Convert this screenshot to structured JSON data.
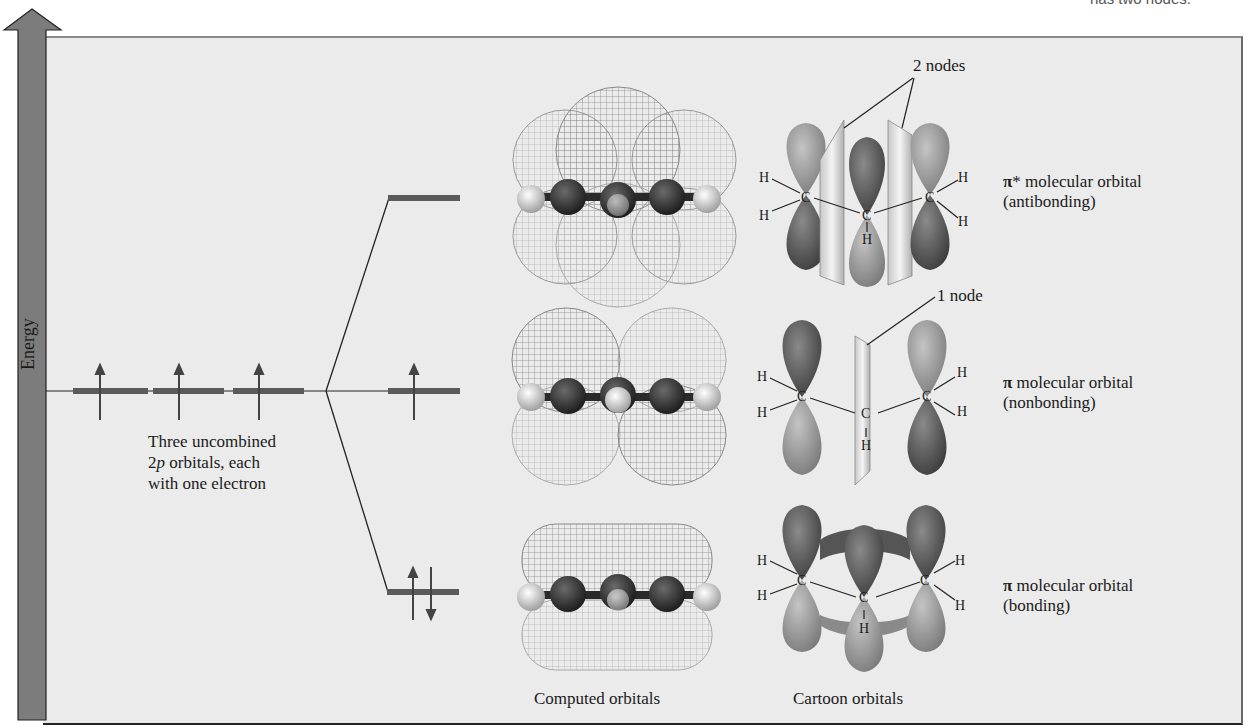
{
  "figure": {
    "cut_caption": "has two nodes.",
    "axis": {
      "label": "Energy"
    },
    "atomic_orbitals": {
      "caption_line1": "Three uncombined",
      "caption_line2_prefix": "2",
      "caption_line2_italic": "p",
      "caption_line2_suffix": " orbitals, each",
      "caption_line3": "with one electron",
      "count": 3,
      "electrons_each": 1
    },
    "molecular_orbitals": [
      {
        "name": "pi-star",
        "symbol": "π",
        "symbol_suffix": "*",
        "line1": " molecular orbital",
        "line2": "(antibonding)",
        "electrons": 0,
        "nodes_label": "2 nodes"
      },
      {
        "name": "pi-nonbonding",
        "symbol": "π",
        "symbol_suffix": "",
        "line1": " molecular orbital",
        "line2": "(nonbonding)",
        "electrons": 1,
        "nodes_label": "1 node"
      },
      {
        "name": "pi-bonding",
        "symbol": "π",
        "symbol_suffix": "",
        "line1": " molecular orbital",
        "line2": "(bonding)",
        "electrons": 2,
        "nodes_label": ""
      }
    ],
    "column_labels": {
      "computed": "Computed orbitals",
      "cartoon": "Cartoon orbitals"
    },
    "atom_labels": {
      "carbon": "C",
      "hydrogen": "H"
    },
    "colors": {
      "panel_bg": "#ebebeb",
      "energy_bar": "#7a7a7a",
      "level_line": "#5a5a5a",
      "lobe_dark": "#555555",
      "lobe_light": "#9a9a9a",
      "mesh": "#8c8c8c"
    }
  }
}
